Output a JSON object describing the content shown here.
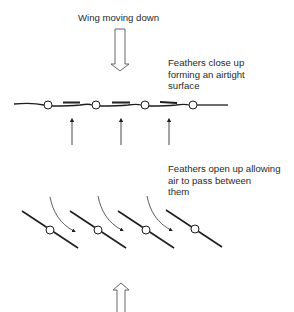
{
  "diagram": {
    "title": "Wing moving down",
    "closed_state": {
      "caption_lines": [
        "Feathers close up",
        "forming an airtight",
        "surface"
      ],
      "feather_count": 4,
      "airflow_arrows": 3
    },
    "open_state": {
      "caption_lines": [
        "Feathers open up allowing",
        "air to pass between",
        "them"
      ],
      "feather_count": 4,
      "airflow_arrows": 3
    },
    "arrows": {
      "top": "hollow arrow pointing down",
      "bottom": "hollow arrow pointing up"
    },
    "colors": {
      "line": "#1e1e1e",
      "background": "#ffffff"
    }
  }
}
